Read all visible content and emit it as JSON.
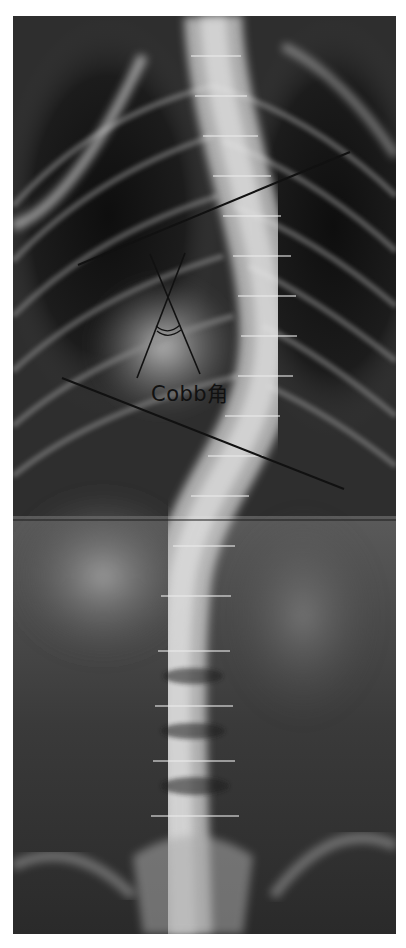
{
  "figure": {
    "annotation_label": "Cobb角",
    "measurement": "Cobb angle",
    "curve_direction": "right convex thoracolumbar curve",
    "elements": [
      "upper-end-vertebra-line",
      "lower-end-vertebra-line",
      "perpendicular-line-1",
      "perpendicular-line-2",
      "angle-arc"
    ]
  },
  "colors": {
    "annotation_line": "#111111",
    "background": "#ffffff",
    "film_dark": "#1a1a1a",
    "bone_light": "#e8e8e8"
  }
}
